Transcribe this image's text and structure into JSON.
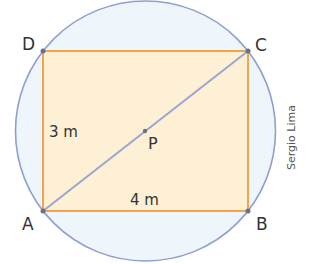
{
  "figure": {
    "points": {
      "A": "A",
      "B": "B",
      "C": "C",
      "D": "D",
      "P": "P"
    },
    "measures": {
      "height": "3 m",
      "width": "4 m"
    },
    "credit": "Sergio Lima",
    "colors": {
      "circle_fill": "#eef6fc",
      "circle_stroke": "#8f9fd4",
      "rect_fill": "#fdf0d4",
      "rect_stroke": "#f4a54a",
      "diagonal": "#9ba6cf",
      "vertex": "#6b6f8a"
    }
  }
}
